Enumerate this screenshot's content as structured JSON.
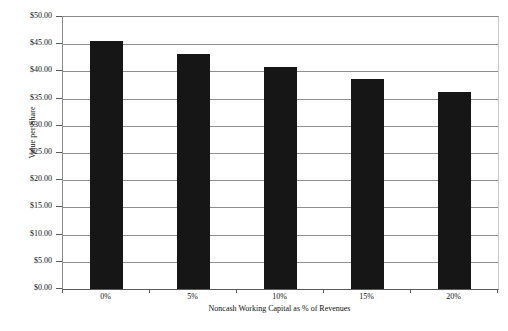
{
  "chart_data": {
    "type": "bar",
    "title": "",
    "xlabel": "Noncash Working Capital as % of Revenues",
    "ylabel": "Value per Share",
    "categories": [
      "0%",
      "5%",
      "10%",
      "15%",
      "20%"
    ],
    "values": [
      45.5,
      43.2,
      40.75,
      38.55,
      36.15
    ],
    "series": [
      {
        "name": "Value per Share",
        "values": [
          45.5,
          43.2,
          40.75,
          38.55,
          36.15
        ]
      }
    ],
    "ylim": [
      0,
      50
    ],
    "ytick_step": 5,
    "ytick_labels": [
      "$0.00",
      "$5.00",
      "$10.00",
      "$15.00",
      "$20.00",
      "$25.00",
      "$30.00",
      "$35.00",
      "$40.00",
      "$45.00",
      "$50.00"
    ],
    "ytick_values": [
      0,
      5,
      10,
      15,
      20,
      25,
      30,
      35,
      40,
      45,
      50
    ],
    "grid": true,
    "grid_axis": "y",
    "legend": false,
    "legend_position": "none",
    "bar_color": "#161616",
    "grid_color": "#909090",
    "axis_color": "#5a5a5a",
    "background_color": "#ffffff",
    "bar_width_ratio": 0.37
  }
}
